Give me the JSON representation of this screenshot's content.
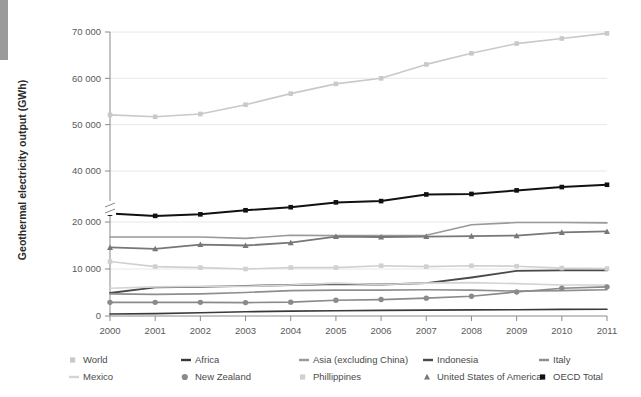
{
  "chart_data": {
    "type": "line",
    "title": "",
    "xlabel": "",
    "ylabel": "Geothermal electricity output (GWh)",
    "categories": [
      "2000",
      "2001",
      "2002",
      "2003",
      "2004",
      "2005",
      "2006",
      "2007",
      "2008",
      "2009",
      "2010",
      "2011"
    ],
    "x": [
      2000,
      2001,
      2002,
      2003,
      2004,
      2005,
      2006,
      2007,
      2008,
      2009,
      2010,
      2011
    ],
    "ylim": [
      0,
      70000
    ],
    "yticks": [
      0,
      10000,
      20000,
      40000,
      50000,
      60000,
      70000
    ],
    "ytick_labels": [
      "0",
      "10 000",
      "20 000",
      "40 000",
      "50 000",
      "60 000",
      "70 000"
    ],
    "axis_break": {
      "present": true,
      "between": [
        20000,
        40000
      ],
      "note": "broken y-axis between 20 000 and 40 000"
    },
    "grid": "horizontal",
    "legend_position": "bottom",
    "series": [
      {
        "name": "World",
        "color": "#c9c9c9",
        "marker": "square",
        "width": 1.6,
        "values": [
          52100,
          51700,
          52300,
          54300,
          56700,
          58800,
          60000,
          63000,
          65400,
          67500,
          68600,
          69700
        ]
      },
      {
        "name": "Africa",
        "color": "#3a3a3a",
        "marker": "none",
        "width": 1.6,
        "values": [
          420,
          520,
          680,
          900,
          1050,
          1120,
          1200,
          1250,
          1300,
          1350,
          1400,
          1450
        ]
      },
      {
        "name": "Asia (excluding China)",
        "color": "#999999",
        "marker": "none",
        "width": 1.6,
        "values": [
          16800,
          16800,
          16800,
          16500,
          17200,
          17100,
          17100,
          17200,
          19400,
          19900,
          19900,
          19800
        ]
      },
      {
        "name": "Indonesia",
        "color": "#4a4a4a",
        "marker": "none",
        "width": 1.8,
        "values": [
          4900,
          6100,
          6200,
          6400,
          6600,
          6800,
          6700,
          7000,
          8200,
          9600,
          9700,
          9700
        ]
      },
      {
        "name": "Italy",
        "color": "#8e8e8e",
        "marker": "none",
        "width": 1.6,
        "values": [
          4700,
          4600,
          4700,
          5000,
          5400,
          5500,
          5500,
          5600,
          5500,
          5300,
          5400,
          5600
        ]
      },
      {
        "name": "Mexico",
        "color": "#d4d4d4",
        "marker": "none",
        "width": 1.6,
        "values": [
          5900,
          6200,
          6300,
          6300,
          6600,
          7000,
          6700,
          7000,
          7100,
          6900,
          6600,
          6600
        ]
      },
      {
        "name": "New Zealand",
        "color": "#8a8a8a",
        "marker": "circle",
        "width": 1.6,
        "values": [
          2900,
          2900,
          2900,
          2850,
          2950,
          3350,
          3500,
          3800,
          4200,
          5100,
          5900,
          6200
        ]
      },
      {
        "name": "Phillippines",
        "color": "#d0d0d0",
        "marker": "square",
        "width": 1.6,
        "values": [
          11600,
          10500,
          10300,
          10000,
          10300,
          10300,
          10700,
          10500,
          10700,
          10600,
          10200,
          10100
        ]
      },
      {
        "name": "United States of America",
        "color": "#777777",
        "marker": "triangle",
        "width": 1.8,
        "values": [
          14600,
          14300,
          15200,
          15000,
          15600,
          16900,
          16800,
          16900,
          17000,
          17100,
          17800,
          18000
        ]
      },
      {
        "name": "OECD Total",
        "color": "#111111",
        "marker": "square",
        "width": 2.0,
        "values": [
          23300,
          22400,
          23000,
          24600,
          25800,
          27700,
          28200,
          30800,
          31000,
          32400,
          33700,
          34600
        ]
      }
    ]
  },
  "legend": {
    "row1": [
      {
        "label": "World",
        "marker": "square",
        "color": "#c9c9c9"
      },
      {
        "label": "Africa",
        "marker": "line",
        "color": "#3a3a3a"
      },
      {
        "label": "Asia (excluding China)",
        "marker": "line",
        "color": "#999999"
      },
      {
        "label": "Indonesia",
        "marker": "line",
        "color": "#4a4a4a"
      },
      {
        "label": "Italy",
        "marker": "line",
        "color": "#8e8e8e"
      }
    ],
    "row2": [
      {
        "label": "Mexico",
        "marker": "line",
        "color": "#d4d4d4"
      },
      {
        "label": "New Zealand",
        "marker": "circle",
        "color": "#8a8a8a"
      },
      {
        "label": "Phillippines",
        "marker": "square",
        "color": "#d0d0d0"
      },
      {
        "label": "United States of America",
        "marker": "triangle",
        "color": "#777777"
      },
      {
        "label": "OECD Total",
        "marker": "square",
        "color": "#111111"
      }
    ]
  },
  "colors": {
    "background": "#ffffff",
    "grid": "#e2e2e2",
    "axis": "#8a8a8a",
    "text": "#4d4d4d",
    "edge_bar": "#9a9a9a"
  }
}
